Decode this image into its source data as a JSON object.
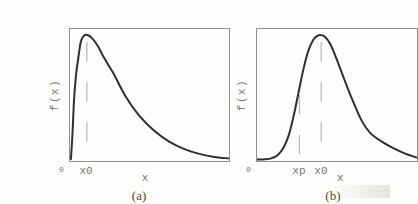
{
  "colors": {
    "bg": "#fdfdfb",
    "curve": "#2f2f2f",
    "frame": "#909090",
    "dash": "#b4b4b4",
    "label": "#757575",
    "caption": "#4a4a4a"
  },
  "chart_data": [
    {
      "type": "line",
      "title": "(a)",
      "ylabel": "f(x)",
      "xlabel": "x",
      "origin_label": "0",
      "legend": null,
      "grid": false,
      "annotations": [
        {
          "label": "x0",
          "style": "dashed-vertical",
          "x_frac": 0.106,
          "y_top_frac": 0.9
        }
      ],
      "x_frac": [
        0.006,
        0.016,
        0.025,
        0.037,
        0.05,
        0.068,
        0.087,
        0.109,
        0.137,
        0.174,
        0.217,
        0.273,
        0.348,
        0.435,
        0.528,
        0.621,
        0.72,
        0.82,
        0.907,
        0.994
      ],
      "y_frac": [
        0.015,
        0.216,
        0.455,
        0.642,
        0.761,
        0.903,
        0.948,
        0.955,
        0.933,
        0.873,
        0.776,
        0.664,
        0.493,
        0.343,
        0.231,
        0.149,
        0.09,
        0.052,
        0.031,
        0.02
      ],
      "layout": {
        "axis_numeric_labels": false,
        "xlabel_x_frac": 0.472,
        "caption_x_frac": 0.435
      }
    },
    {
      "type": "line",
      "title": "(b)",
      "ylabel": "f(x)",
      "xlabel": "x",
      "origin_label": "0",
      "legend": null,
      "grid": false,
      "annotations": [
        {
          "label": "xp",
          "style": "dashed-vertical",
          "x_frac": 0.265,
          "y_top_frac": 0.5
        },
        {
          "label": "x0",
          "style": "dashed-vertical",
          "x_frac": 0.401,
          "y_top_frac": 0.9
        }
      ],
      "x_frac": [
        0.0,
        0.049,
        0.093,
        0.13,
        0.167,
        0.198,
        0.228,
        0.259,
        0.29,
        0.321,
        0.352,
        0.377,
        0.398,
        0.426,
        0.457,
        0.494,
        0.543,
        0.599,
        0.654,
        0.71,
        0.778,
        0.852,
        0.926,
        1.0
      ],
      "y_frac": [
        0.011,
        0.013,
        0.022,
        0.045,
        0.104,
        0.194,
        0.336,
        0.515,
        0.694,
        0.836,
        0.918,
        0.948,
        0.955,
        0.94,
        0.888,
        0.784,
        0.627,
        0.455,
        0.306,
        0.209,
        0.149,
        0.097,
        0.056,
        0.026
      ],
      "layout": {
        "axis_numeric_labels": false,
        "xlabel_x_frac": 0.52,
        "caption_x_frac": 0.475
      }
    }
  ]
}
